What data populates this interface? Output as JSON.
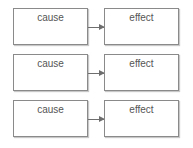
{
  "diagram": {
    "type": "cause-effect pairs",
    "rows": [
      {
        "cause": "cause",
        "effect": "effect"
      },
      {
        "cause": "cause",
        "effect": "effect"
      },
      {
        "cause": "cause",
        "effect": "effect"
      }
    ],
    "colors": {
      "border": "#8a8a8a",
      "arrow": "#6e6e6e",
      "text": "#555555"
    }
  }
}
